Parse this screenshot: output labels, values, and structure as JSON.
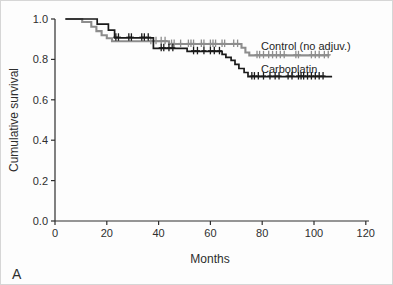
{
  "panel_label": "A",
  "chart_data": {
    "type": "line",
    "subtype": "kaplan-meier-step-curves",
    "title": "",
    "xlabel": "Months",
    "ylabel": "Cumulative survival",
    "xlim": [
      0,
      120
    ],
    "ylim": [
      0.0,
      1.0
    ],
    "xticks": [
      0,
      20,
      40,
      60,
      80,
      100,
      120
    ],
    "yticks": [
      0.0,
      0.2,
      0.4,
      0.6,
      0.8,
      1.0
    ],
    "grid": false,
    "legend_position": "inline-right-of-curves",
    "axis_color": "#2e2e2e",
    "series": [
      {
        "name": "Control (no adjuv.)",
        "color": "#8d8d8d",
        "steps": [
          [
            4,
            1.0
          ],
          [
            10.5,
            0.985
          ],
          [
            14,
            0.962
          ],
          [
            16,
            0.94
          ],
          [
            18,
            0.92
          ],
          [
            20,
            0.905
          ],
          [
            22,
            0.89
          ],
          [
            44,
            0.876
          ],
          [
            72,
            0.858
          ],
          [
            73.5,
            0.834
          ],
          [
            75,
            0.82
          ],
          [
            106,
            0.82
          ]
        ],
        "censor_marks": [
          [
            37,
            0.89
          ],
          [
            39,
            0.89
          ],
          [
            41,
            0.89
          ],
          [
            42.5,
            0.89
          ],
          [
            45,
            0.876
          ],
          [
            46,
            0.876
          ],
          [
            48.5,
            0.876
          ],
          [
            51.5,
            0.876
          ],
          [
            52.5,
            0.876
          ],
          [
            53.5,
            0.876
          ],
          [
            56.5,
            0.876
          ],
          [
            57.5,
            0.876
          ],
          [
            60,
            0.876
          ],
          [
            61,
            0.876
          ],
          [
            62,
            0.876
          ],
          [
            64.5,
            0.876
          ],
          [
            65.5,
            0.876
          ],
          [
            69,
            0.876
          ],
          [
            70.5,
            0.876
          ],
          [
            78,
            0.82
          ],
          [
            79,
            0.82
          ],
          [
            80.5,
            0.82
          ],
          [
            82.5,
            0.82
          ],
          [
            84,
            0.82
          ],
          [
            85.5,
            0.82
          ],
          [
            87,
            0.82
          ],
          [
            88.5,
            0.82
          ],
          [
            93,
            0.82
          ],
          [
            94,
            0.82
          ],
          [
            99,
            0.82
          ],
          [
            100.5,
            0.82
          ],
          [
            102,
            0.82
          ],
          [
            104,
            0.82
          ],
          [
            105.5,
            0.82
          ]
        ]
      },
      {
        "name": "Carboplatin",
        "color": "#1a1a1a",
        "steps": [
          [
            4,
            1.0
          ],
          [
            16.3,
            0.975
          ],
          [
            20.6,
            0.945
          ],
          [
            23,
            0.907
          ],
          [
            38,
            0.855
          ],
          [
            51,
            0.84
          ],
          [
            64.5,
            0.825
          ],
          [
            66,
            0.81
          ],
          [
            68,
            0.795
          ],
          [
            69.5,
            0.775
          ],
          [
            71,
            0.755
          ],
          [
            73,
            0.735
          ],
          [
            74.5,
            0.715
          ],
          [
            107,
            0.715
          ]
        ],
        "censor_marks": [
          [
            23.5,
            0.907
          ],
          [
            24.5,
            0.907
          ],
          [
            28.5,
            0.907
          ],
          [
            29.5,
            0.907
          ],
          [
            33.5,
            0.907
          ],
          [
            34.5,
            0.907
          ],
          [
            36,
            0.907
          ],
          [
            41,
            0.855
          ],
          [
            42,
            0.855
          ],
          [
            44,
            0.855
          ],
          [
            45.5,
            0.855
          ],
          [
            53.5,
            0.84
          ],
          [
            55,
            0.84
          ],
          [
            57.5,
            0.84
          ],
          [
            60,
            0.84
          ],
          [
            61.5,
            0.84
          ],
          [
            63.5,
            0.84
          ],
          [
            76,
            0.715
          ],
          [
            77,
            0.715
          ],
          [
            78.5,
            0.715
          ],
          [
            80.5,
            0.715
          ],
          [
            83,
            0.715
          ],
          [
            85,
            0.715
          ],
          [
            86.5,
            0.715
          ],
          [
            90,
            0.715
          ],
          [
            91.5,
            0.715
          ],
          [
            94,
            0.715
          ],
          [
            95,
            0.715
          ],
          [
            96,
            0.715
          ],
          [
            97.5,
            0.715
          ],
          [
            99,
            0.715
          ],
          [
            100.5,
            0.715
          ],
          [
            102,
            0.715
          ],
          [
            103.5,
            0.715
          ]
        ]
      }
    ]
  }
}
